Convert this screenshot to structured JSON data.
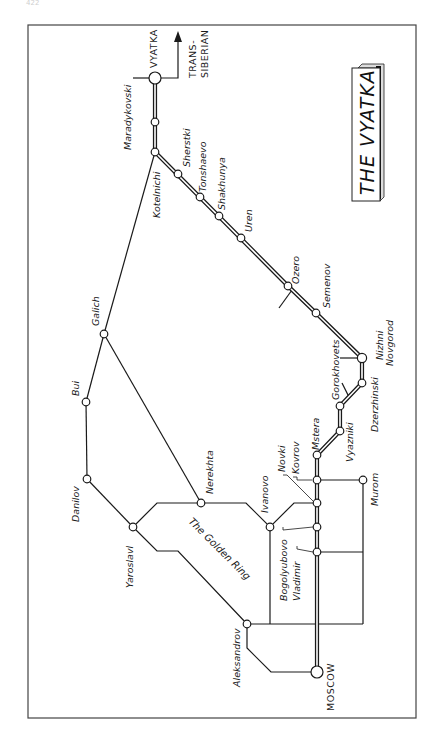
{
  "page": {
    "number": "422"
  },
  "map": {
    "title": "THE VYATKA",
    "region_label": "The Golden Ring",
    "trans_siberian_line1": "TRANS-",
    "trans_siberian_line2": "SIBERIAN",
    "stations": {
      "vyatka": "VYATKA",
      "maradykovski": "Maradykovski",
      "kotelnichi": "Kotelnichi",
      "sherstki": "Sherstki",
      "tonshaevo": "Tonshaevo",
      "shakhunya": "Shakhunya",
      "uren": "Uren",
      "ozero": "Ozero",
      "semenov": "Semenov",
      "nizhni_1": "Nizhni",
      "nizhni_2": "Novgorod",
      "dzerzhinski": "Dzerzhinski",
      "gorokhovets": "Gorokhovets",
      "vyazniki": "Vyazniki",
      "mstera": "Mstera",
      "kovrov": "Kovrov",
      "novki": "Novki",
      "murom": "Murom",
      "ivanovo": "Ivanovo",
      "bogolyubovo": "Bogolyubovo",
      "vladimir": "Vladimir",
      "nerekhta": "Nerekhta",
      "galich": "Galich",
      "bui": "Bui",
      "danilov": "Danilov",
      "yaroslavl": "Yaroslavl",
      "aleksandrov": "Aleksandrov",
      "moscow": "MOSCOW"
    },
    "colors": {
      "line": "#1a1a1a",
      "paper": "#ffffff",
      "frame": "#444444"
    }
  }
}
